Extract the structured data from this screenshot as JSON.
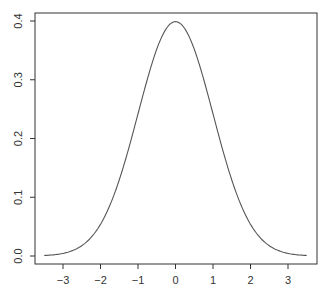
{
  "chart_data": {
    "type": "line",
    "title": "",
    "xlabel": "",
    "ylabel": "",
    "xlim": [
      -3.6,
      3.6
    ],
    "ylim": [
      -0.016,
      0.416
    ],
    "grid": false,
    "legend": null,
    "x_ticks": [
      -3,
      -2,
      -1,
      0,
      1,
      2,
      3
    ],
    "x_tick_labels": [
      "−3",
      "−2",
      "−1",
      "0",
      "1",
      "2",
      "3"
    ],
    "y_ticks": [
      0.0,
      0.1,
      0.2,
      0.3,
      0.4
    ],
    "y_tick_labels": [
      "0.0",
      "0.1",
      "0.2",
      "0.3",
      "0.4"
    ],
    "series": [
      {
        "name": "standard normal density",
        "x_range": [
          -3.5,
          3.5
        ],
        "function": "dnorm",
        "sample_points": [
          {
            "x": -3.5,
            "y": 0.0009
          },
          {
            "x": -3.0,
            "y": 0.0044
          },
          {
            "x": -2.0,
            "y": 0.054
          },
          {
            "x": -1.0,
            "y": 0.242
          },
          {
            "x": 0.0,
            "y": 0.399
          },
          {
            "x": 1.0,
            "y": 0.242
          },
          {
            "x": 2.0,
            "y": 0.054
          },
          {
            "x": 3.0,
            "y": 0.0044
          },
          {
            "x": 3.5,
            "y": 0.0009
          }
        ],
        "color": "#555555"
      }
    ]
  }
}
